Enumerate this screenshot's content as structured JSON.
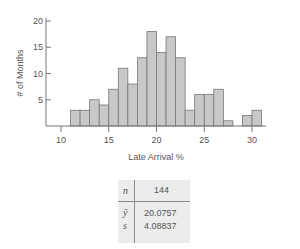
{
  "chart_data": {
    "type": "bar",
    "title": "",
    "xlabel": "Late Arrival %",
    "ylabel": "# of Months",
    "bin_edges": [
      11,
      12,
      13,
      14,
      15,
      16,
      17,
      18,
      19,
      20,
      21,
      22,
      23,
      24,
      25,
      26,
      27,
      28,
      29,
      30,
      31
    ],
    "categories": [
      "11-12",
      "12-13",
      "13-14",
      "14-15",
      "15-16",
      "16-17",
      "17-18",
      "18-19",
      "19-20",
      "20-21",
      "21-22",
      "22-23",
      "23-24",
      "24-25",
      "25-26",
      "26-27",
      "27-28",
      "28-29",
      "29-30",
      "30-31"
    ],
    "values": [
      3,
      3,
      5,
      4,
      7,
      11,
      8,
      13,
      18,
      14,
      17,
      13,
      3,
      6,
      6,
      7,
      1,
      0,
      2,
      3
    ],
    "xticks": [
      10,
      15,
      20,
      25,
      30
    ],
    "yticks": [
      5,
      10,
      15,
      20
    ],
    "xlim": [
      9.5,
      32
    ],
    "ylim": [
      0,
      20
    ],
    "grid": false,
    "bar_color": "#c8c8c8",
    "edge_color": "#777777"
  },
  "stats_table": {
    "n_label": "n",
    "n_value": "144",
    "mean_label": "ȳ",
    "mean_value": "20.0757",
    "sd_label": "s",
    "sd_value": "4.08837"
  }
}
